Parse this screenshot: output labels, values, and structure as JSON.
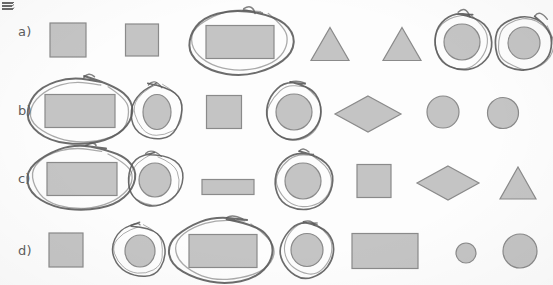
{
  "document": {
    "kind": "scanned-worksheet",
    "background_color": "#fdfdfd",
    "shape_fill_color": "#c4c4c4",
    "shape_stroke_color": "#8a8a8a",
    "annotation_stroke_color": "#585858",
    "label_color": "#5d5d5d",
    "corner_mark": "partial-scan-mark"
  },
  "rows": [
    {
      "label": "a)",
      "label_x": 18,
      "label_y": 33,
      "items": [
        {
          "name": "square",
          "shape": "square",
          "cx": 68,
          "cy": 40,
          "w": 36,
          "h": 34,
          "circled": false
        },
        {
          "name": "square",
          "shape": "square",
          "cx": 142,
          "cy": 40,
          "w": 33,
          "h": 32,
          "circled": false
        },
        {
          "name": "rectangle",
          "shape": "rectangle",
          "cx": 240,
          "cy": 42,
          "w": 68,
          "h": 33,
          "circled": true,
          "loop": "oval-wide"
        },
        {
          "name": "triangle",
          "shape": "triangle",
          "cx": 330,
          "cy": 44,
          "w": 38,
          "h": 33,
          "circled": false
        },
        {
          "name": "triangle",
          "shape": "triangle",
          "cx": 402,
          "cy": 44,
          "w": 38,
          "h": 33,
          "circled": false
        },
        {
          "name": "circle",
          "shape": "circle",
          "cx": 462,
          "cy": 42,
          "w": 36,
          "h": 36,
          "circled": true,
          "loop": "round-tight"
        },
        {
          "name": "circle",
          "shape": "circle",
          "cx": 524,
          "cy": 43,
          "w": 32,
          "h": 32,
          "circled": true,
          "loop": "round-spiral"
        }
      ]
    },
    {
      "label": "b)",
      "label_x": 18,
      "label_y": 112,
      "items": [
        {
          "name": "rectangle",
          "shape": "rectangle",
          "cx": 80,
          "cy": 111,
          "w": 70,
          "h": 33,
          "circled": true,
          "loop": "oval-wide"
        },
        {
          "name": "ellipse",
          "shape": "circle",
          "cx": 157,
          "cy": 112,
          "w": 28,
          "h": 35,
          "circled": true,
          "loop": "round-tall"
        },
        {
          "name": "square",
          "shape": "square",
          "cx": 224,
          "cy": 112,
          "w": 35,
          "h": 33,
          "circled": false
        },
        {
          "name": "circle",
          "shape": "circle",
          "cx": 294,
          "cy": 112,
          "w": 36,
          "h": 36,
          "circled": true,
          "loop": "round-tight"
        },
        {
          "name": "diamond",
          "shape": "diamond",
          "cx": 368,
          "cy": 114,
          "w": 66,
          "h": 36,
          "circled": false
        },
        {
          "name": "circle",
          "shape": "circle",
          "cx": 443,
          "cy": 112,
          "w": 32,
          "h": 32,
          "circled": false
        },
        {
          "name": "circle",
          "shape": "circle",
          "cx": 503,
          "cy": 113,
          "w": 31,
          "h": 31,
          "circled": false
        }
      ]
    },
    {
      "label": "c)",
      "label_x": 18,
      "label_y": 180,
      "items": [
        {
          "name": "rectangle",
          "shape": "rectangle",
          "cx": 82,
          "cy": 179,
          "w": 70,
          "h": 33,
          "circled": true,
          "loop": "oval-wide"
        },
        {
          "name": "circle",
          "shape": "circle",
          "cx": 155,
          "cy": 180,
          "w": 32,
          "h": 34,
          "circled": true,
          "loop": "round-tall"
        },
        {
          "name": "bar",
          "shape": "rectangle",
          "cx": 228,
          "cy": 187,
          "w": 52,
          "h": 15,
          "circled": false
        },
        {
          "name": "circle",
          "shape": "circle",
          "cx": 303,
          "cy": 181,
          "w": 36,
          "h": 36,
          "circled": true,
          "loop": "round-tight"
        },
        {
          "name": "square",
          "shape": "square",
          "cx": 374,
          "cy": 181,
          "w": 34,
          "h": 33,
          "circled": false
        },
        {
          "name": "diamond",
          "shape": "diamond",
          "cx": 448,
          "cy": 183,
          "w": 62,
          "h": 34,
          "circled": false
        },
        {
          "name": "triangle",
          "shape": "triangle",
          "cx": 518,
          "cy": 183,
          "w": 36,
          "h": 32,
          "circled": false
        }
      ]
    },
    {
      "label": "d)",
      "label_x": 18,
      "label_y": 252,
      "items": [
        {
          "name": "square",
          "shape": "square",
          "cx": 66,
          "cy": 250,
          "w": 34,
          "h": 34,
          "circled": false
        },
        {
          "name": "circle",
          "shape": "circle",
          "cx": 140,
          "cy": 251,
          "w": 30,
          "h": 32,
          "circled": true,
          "loop": "round-tall"
        },
        {
          "name": "rectangle",
          "shape": "rectangle",
          "cx": 223,
          "cy": 251,
          "w": 68,
          "h": 33,
          "circled": true,
          "loop": "oval-wide"
        },
        {
          "name": "circle",
          "shape": "circle",
          "cx": 307,
          "cy": 250,
          "w": 32,
          "h": 33,
          "circled": true,
          "loop": "round-tight"
        },
        {
          "name": "rectangle",
          "shape": "rectangle",
          "cx": 385,
          "cy": 251,
          "w": 66,
          "h": 35,
          "circled": false
        },
        {
          "name": "circle",
          "shape": "circle",
          "cx": 466,
          "cy": 253,
          "w": 20,
          "h": 20,
          "circled": false
        },
        {
          "name": "circle",
          "shape": "circle",
          "cx": 520,
          "cy": 251,
          "w": 34,
          "h": 34,
          "circled": false
        }
      ]
    }
  ]
}
